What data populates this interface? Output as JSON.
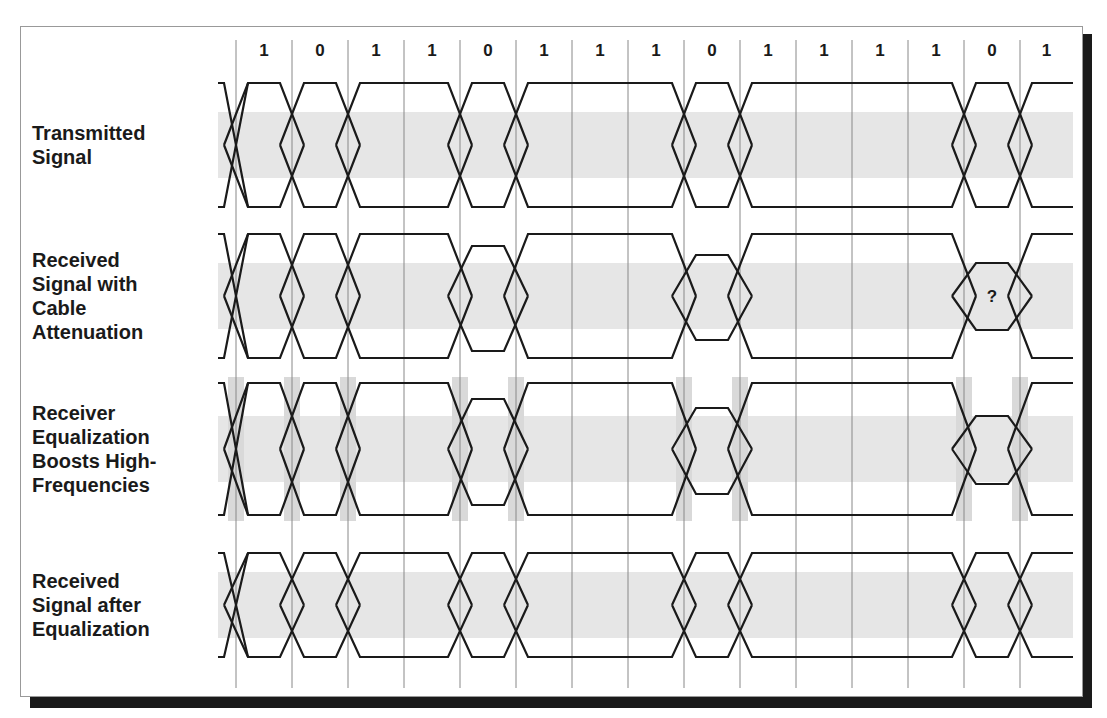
{
  "figure": {
    "title": "",
    "bits": [
      "1",
      "0",
      "1",
      "1",
      "0",
      "1",
      "1",
      "1",
      "0",
      "1",
      "1",
      "1",
      "1",
      "0",
      "1"
    ],
    "grid": {
      "x0": 236,
      "step": 56,
      "count": 15,
      "top": 40,
      "bottom": 688
    },
    "rows": [
      {
        "label": [
          "Transmitted",
          "Signal"
        ],
        "top": 83,
        "bottom": 207,
        "shrink": [],
        "shaded_transitions": false,
        "marker": null
      },
      {
        "label": [
          "Received",
          "Signal with",
          "Cable",
          "Attenuation"
        ],
        "top": 234,
        "bottom": 358,
        "shrink": [
          {
            "bit": 4,
            "top": 246,
            "bottom": 351
          },
          {
            "bit": 8,
            "top": 255,
            "bottom": 340
          },
          {
            "bit": 13,
            "top": 263,
            "bottom": 330
          }
        ],
        "shaded_transitions": false,
        "marker": {
          "bit": 13,
          "text": "?"
        }
      },
      {
        "label": [
          "Receiver",
          "Equalization",
          "Boosts High-",
          "Frequencies"
        ],
        "top": 383,
        "bottom": 515,
        "shrink": [
          {
            "bit": 4,
            "top": 399,
            "bottom": 505
          },
          {
            "bit": 8,
            "top": 408,
            "bottom": 494
          },
          {
            "bit": 13,
            "top": 416,
            "bottom": 484
          }
        ],
        "shaded_transitions": true,
        "marker": null
      },
      {
        "label": [
          "Received",
          "Signal after",
          "Equalization"
        ],
        "top": 553,
        "bottom": 657,
        "shrink": [],
        "shaded_transitions": false,
        "marker": null
      }
    ],
    "colors": {
      "line": "#1a1a1a",
      "grid": "#888888",
      "band": "#e6e6e6",
      "transition_shade": "#d9d9d9",
      "shadow": "#1a1a1a",
      "frame": "#999999"
    }
  }
}
